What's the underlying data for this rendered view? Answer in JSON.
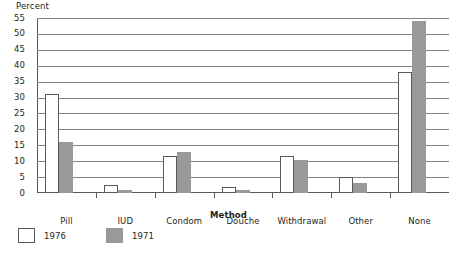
{
  "chart_data": {
    "type": "bar",
    "title": "",
    "xlabel": "Method",
    "ylabel": "Percent",
    "ylim": [
      0,
      55
    ],
    "yticks": [
      0,
      5,
      10,
      15,
      20,
      25,
      30,
      35,
      40,
      45,
      50,
      55
    ],
    "grid": true,
    "legend_position": "bottom-left",
    "categories": [
      "Pill",
      "IUD",
      "Condom",
      "Douche",
      "Withdrawal",
      "Other",
      "None"
    ],
    "series": [
      {
        "name": "1976",
        "color": "#ffffff",
        "values": [
          31,
          2.5,
          11.5,
          2,
          11.5,
          5,
          38
        ]
      },
      {
        "name": "1971",
        "color": "#999999",
        "values": [
          16,
          1,
          13,
          1,
          10.5,
          3,
          54
        ]
      }
    ]
  },
  "axes": {
    "y_title": "Percent",
    "x_title": "Method",
    "y_tick_labels": [
      "55",
      "50",
      "45",
      "40",
      "35",
      "30",
      "25",
      "20",
      "15",
      "10",
      "5",
      "0"
    ]
  },
  "legend": {
    "items": [
      {
        "label": "1976",
        "swatch": "open-square"
      },
      {
        "label": "1971",
        "swatch": "filled-square"
      }
    ]
  },
  "colors": {
    "bar_1971": "#999999",
    "bar_1976": "#ffffff",
    "axis": "#58595b",
    "grid": "#808285",
    "text": "#231f20",
    "background": "#ffffff"
  }
}
